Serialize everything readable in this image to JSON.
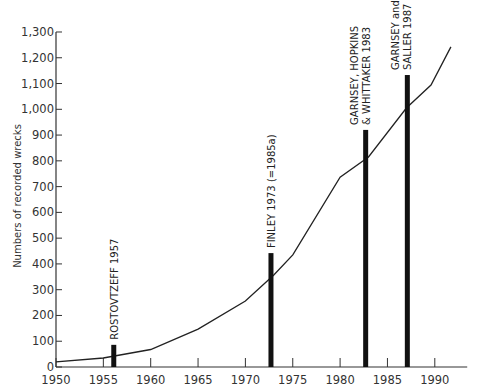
{
  "chart_data": {
    "type": "line",
    "title": "",
    "xlabel": "",
    "ylabel": "Numbers of recorded wrecks",
    "xlim": [
      1950,
      1993
    ],
    "ylim": [
      0,
      1300
    ],
    "grid": false,
    "x_ticks": [
      1950,
      1955,
      1960,
      1965,
      1970,
      1975,
      1980,
      1985,
      1990
    ],
    "x_tick_labels": [
      "1950",
      "1955",
      "1960",
      "1965",
      "1970",
      "1975",
      "1980",
      "1985",
      "1990"
    ],
    "y_ticks": [
      0,
      100,
      200,
      300,
      400,
      500,
      600,
      700,
      800,
      900,
      1000,
      1100,
      1200,
      1300
    ],
    "y_tick_labels": [
      "0",
      "100",
      "200",
      "300",
      "400",
      "500",
      "600",
      "700",
      "800",
      "900",
      "1,000",
      "1,100",
      "1,200",
      "1,300"
    ],
    "series": [
      {
        "name": "Cumulative recorded wrecks",
        "x": [
          1950,
          1955,
          1960,
          1965,
          1970,
          1973,
          1975,
          1980,
          1983,
          1987,
          1989.6,
          1991.7
        ],
        "values": [
          20,
          35,
          68,
          147,
          256,
          357,
          435,
          737,
          815,
          1005,
          1094,
          1242
        ]
      }
    ],
    "annotations": [
      {
        "label_lines": [
          "ROSTOVTZEFF 1957"
        ],
        "x": 1956.1,
        "value": 86
      },
      {
        "label_lines": [
          "FINLEY 1973 (=1985a)"
        ],
        "x": 1972.7,
        "value": 442
      },
      {
        "label_lines": [
          "GARNSEY, HOPKINS",
          "& WHITTAKER 1983"
        ],
        "x": 1982.7,
        "value": 920
      },
      {
        "label_lines": [
          "GARNSEY and",
          "SALLER 1987"
        ],
        "x": 1987.1,
        "value": 1133
      }
    ],
    "legend": null
  },
  "layout": {
    "plot": {
      "x0_px": 56,
      "y0_px": 367,
      "px_per_year": 9.47,
      "px_per_unit": 0.2577
    },
    "line_color": "#222222",
    "bar_color": "#111111"
  }
}
